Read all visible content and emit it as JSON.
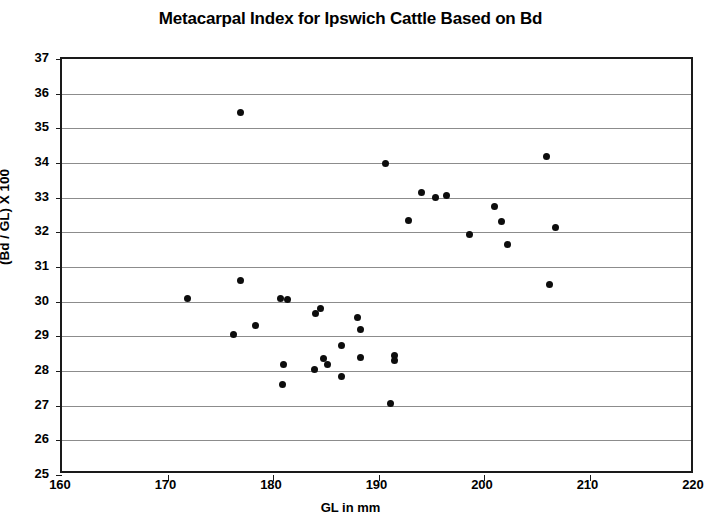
{
  "chart_data": {
    "type": "scatter",
    "title": "Metacarpal Index for Ipswich Cattle Based on Bd",
    "xlabel": "GL in mm",
    "ylabel": "(Bd / GL) X 100",
    "xlim": [
      160,
      220
    ],
    "ylim": [
      25,
      37
    ],
    "xticks": [
      160,
      170,
      180,
      190,
      200,
      210,
      220
    ],
    "yticks": [
      25,
      26,
      27,
      28,
      29,
      30,
      31,
      32,
      33,
      34,
      35,
      36,
      37
    ],
    "grid": "horizontal",
    "legend": "none",
    "marker": "filled-circle",
    "marker_color": "#0d0d0d",
    "points": [
      {
        "x": 171.9,
        "y": 30.1
      },
      {
        "x": 176.9,
        "y": 35.45
      },
      {
        "x": 176.9,
        "y": 30.6
      },
      {
        "x": 176.3,
        "y": 29.05
      },
      {
        "x": 178.3,
        "y": 29.3
      },
      {
        "x": 180.7,
        "y": 30.1
      },
      {
        "x": 181.4,
        "y": 30.05
      },
      {
        "x": 181.0,
        "y": 28.2
      },
      {
        "x": 180.9,
        "y": 27.6
      },
      {
        "x": 184.0,
        "y": 29.65
      },
      {
        "x": 184.5,
        "y": 29.8
      },
      {
        "x": 183.9,
        "y": 28.05
      },
      {
        "x": 184.8,
        "y": 28.35
      },
      {
        "x": 185.2,
        "y": 28.2
      },
      {
        "x": 186.5,
        "y": 28.75
      },
      {
        "x": 186.5,
        "y": 27.85
      },
      {
        "x": 188.0,
        "y": 29.55
      },
      {
        "x": 188.3,
        "y": 29.2
      },
      {
        "x": 188.3,
        "y": 28.4
      },
      {
        "x": 191.5,
        "y": 28.45
      },
      {
        "x": 191.5,
        "y": 28.3
      },
      {
        "x": 191.1,
        "y": 27.05
      },
      {
        "x": 190.7,
        "y": 34.0
      },
      {
        "x": 192.8,
        "y": 32.35
      },
      {
        "x": 194.1,
        "y": 33.15
      },
      {
        "x": 195.4,
        "y": 33.0
      },
      {
        "x": 196.4,
        "y": 33.05
      },
      {
        "x": 198.6,
        "y": 31.95
      },
      {
        "x": 201.0,
        "y": 32.75
      },
      {
        "x": 201.7,
        "y": 32.3
      },
      {
        "x": 202.2,
        "y": 31.65
      },
      {
        "x": 205.9,
        "y": 34.2
      },
      {
        "x": 206.2,
        "y": 30.5
      },
      {
        "x": 206.8,
        "y": 32.15
      }
    ]
  }
}
